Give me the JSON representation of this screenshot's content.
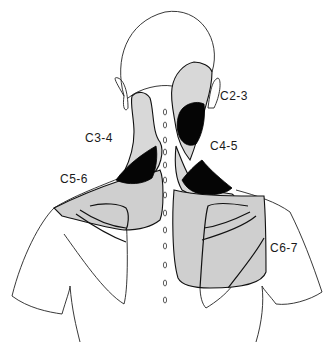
{
  "figure": {
    "colors": {
      "pain_zone_fill": "#cfcfcf",
      "core_pain_fill": "#050505",
      "outline": "#222222",
      "background": "#ffffff"
    },
    "labels": [
      {
        "id": "c2-3",
        "text": "C2-3"
      },
      {
        "id": "c3-4",
        "text": "C3-4"
      },
      {
        "id": "c4-5",
        "text": "C4-5"
      },
      {
        "id": "c5-6",
        "text": "C5-6"
      },
      {
        "id": "c6-7",
        "text": "C6-7"
      }
    ],
    "spine_marker_count": 13
  }
}
